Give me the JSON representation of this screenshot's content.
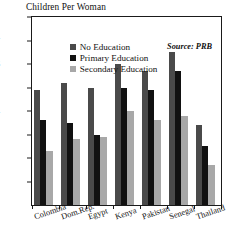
{
  "chart_data": {
    "type": "bar",
    "title": "Children Per Woman",
    "xlabel": "",
    "ylabel": "",
    "ylim": [
      0,
      8
    ],
    "yticks": [
      1,
      2,
      3,
      4,
      5,
      6,
      7,
      8
    ],
    "grid": false,
    "legend_position": "inside top-left",
    "annotations": [
      "Source: PRB"
    ],
    "categories": [
      "Colombia",
      "Dom.Rep.",
      "Egypt",
      "Kenya",
      "Pakistan",
      "Senegal",
      "Thailand"
    ],
    "series": [
      {
        "name": "No Education",
        "color": "#4a4a4a",
        "values": [
          4.9,
          5.2,
          5.0,
          6.0,
          5.7,
          6.5,
          3.4
        ]
      },
      {
        "name": "Primary Education",
        "color": "#111111",
        "values": [
          3.6,
          3.5,
          3.0,
          5.0,
          4.9,
          5.7,
          2.5
        ]
      },
      {
        "name": "Secondary Education",
        "color": "#a8a8a8",
        "values": [
          2.3,
          2.8,
          2.9,
          4.0,
          3.6,
          3.8,
          1.7
        ]
      }
    ]
  },
  "source": {
    "text": "Source: PRB"
  }
}
